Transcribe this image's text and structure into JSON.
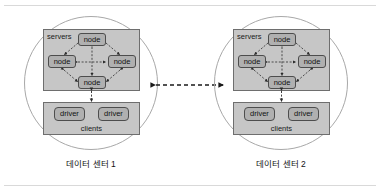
{
  "figure": {
    "type": "diagram",
    "title": "",
    "background_color": "#ffffff",
    "frame_rule_color": "#d9d9d9"
  },
  "palette": {
    "group_fill": "#c6c6c6",
    "group_stroke": "#6e6e6e",
    "chip_fill": "#b0b0b0",
    "chip_stroke": "#4d4d4d",
    "circle_stroke": "#a8a8a8",
    "edge_color": "#2b2b2b",
    "text_color": "#111111"
  },
  "datacenters": [
    {
      "id": "dc1",
      "caption": "데이터 센터 1",
      "servers": {
        "label": "servers",
        "nodes": [
          {
            "position": "top",
            "label": "node"
          },
          {
            "position": "left",
            "label": "node"
          },
          {
            "position": "right",
            "label": "node"
          },
          {
            "position": "bottom",
            "label": "node"
          }
        ]
      },
      "clients": {
        "label": "clients",
        "drivers": [
          {
            "label": "driver"
          },
          {
            "label": "driver"
          }
        ]
      }
    },
    {
      "id": "dc2",
      "caption": "데이터 센터 2",
      "servers": {
        "label": "servers",
        "nodes": [
          {
            "position": "top",
            "label": "node"
          },
          {
            "position": "left",
            "label": "node"
          },
          {
            "position": "right",
            "label": "node"
          },
          {
            "position": "bottom",
            "label": "node"
          }
        ]
      },
      "clients": {
        "label": "clients",
        "drivers": [
          {
            "label": "driver"
          },
          {
            "label": "driver"
          }
        ]
      }
    }
  ],
  "inter_dc_link": {
    "label": "",
    "style": "dashed",
    "arrows": "bidirectional"
  }
}
